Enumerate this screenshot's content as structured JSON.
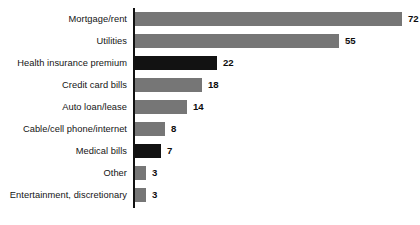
{
  "chart_data": {
    "type": "bar",
    "orientation": "horizontal",
    "title": "",
    "subtitle": "",
    "xlabel": "",
    "ylabel": "",
    "grid": false,
    "legend": "none",
    "xlim": [
      0,
      72
    ],
    "categories": [
      "Mortgage/rent",
      "Utilities",
      "Health insurance premium",
      "Credit card bills",
      "Auto loan/lease",
      "Cable/cell phone/internet",
      "Medical bills",
      "Other",
      "Entertainment, discretionary"
    ],
    "values": [
      72,
      55,
      22,
      18,
      14,
      8,
      7,
      3,
      3
    ],
    "value_labels": [
      "72",
      "55",
      "22",
      "18",
      "14",
      "8",
      "7",
      "3",
      "3"
    ],
    "highlighted": [
      false,
      false,
      true,
      false,
      false,
      false,
      true,
      false,
      false
    ],
    "bars": [
      {
        "category": "Mortgage/rent",
        "value": 72,
        "label": "72",
        "highlight": false
      },
      {
        "category": "Utilities",
        "value": 55,
        "label": "55",
        "highlight": false
      },
      {
        "category": "Health insurance premium",
        "value": 22,
        "label": "22",
        "highlight": true
      },
      {
        "category": "Credit card bills",
        "value": 18,
        "label": "18",
        "highlight": false
      },
      {
        "category": "Auto loan/lease",
        "value": 14,
        "label": "14",
        "highlight": false
      },
      {
        "category": "Cable/cell phone/internet",
        "value": 8,
        "label": "8",
        "highlight": false
      },
      {
        "category": "Medical bills",
        "value": 7,
        "label": "7",
        "highlight": true
      },
      {
        "category": "Other",
        "value": 3,
        "label": "3",
        "highlight": false
      },
      {
        "category": "Entertainment, discretionary",
        "value": 3,
        "label": "3",
        "highlight": false
      }
    ]
  },
  "style": {
    "bar_color": "#767676",
    "bar_highlight_color": "#121212",
    "axis_color": "#111111",
    "text_color": "#141414",
    "background": "#ffffff"
  }
}
